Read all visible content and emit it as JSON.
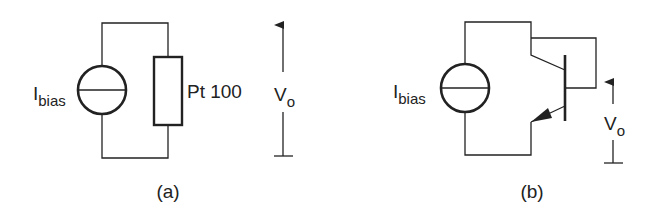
{
  "figure": {
    "panels": [
      {
        "id": "a",
        "caption": "(a)",
        "source_label": "I",
        "source_subscript": "bias",
        "resistor_label": "Pt 100",
        "output_label": "V",
        "output_subscript": "o"
      },
      {
        "id": "b",
        "caption": "(b)",
        "source_label": "I",
        "source_subscript": "bias",
        "output_label": "V",
        "output_subscript": "o"
      }
    ],
    "colors": {
      "stroke": "#222222",
      "background": "#ffffff"
    }
  }
}
